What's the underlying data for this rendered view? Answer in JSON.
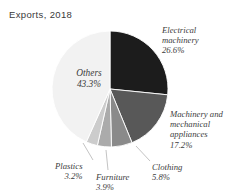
{
  "chart": {
    "title": "Exports, 2018",
    "background_color": "#ffffff",
    "center_x": 110,
    "center_y": 89,
    "radius": 58
  },
  "chart_data": {
    "type": "pie",
    "title": "Exports, 2018",
    "xlabel": "",
    "ylabel": "",
    "units": "percent",
    "start_angle_deg": 0,
    "direction": "clockwise",
    "legend_position": "none",
    "grid": false,
    "categories": [
      "Electrical machinery",
      "Machinery and mechanical appliances",
      "Clothing",
      "Furniture",
      "Plastics",
      "Others"
    ],
    "values": [
      26.6,
      17.2,
      5.8,
      3.9,
      3.2,
      43.3
    ],
    "colors": [
      "#1c1c1c",
      "#585858",
      "#8a8a8a",
      "#ababab",
      "#cccccc",
      "#f2f2f2"
    ],
    "slices": [
      {
        "name": "Electrical machinery",
        "label_line1": "Electrical",
        "label_line2": "machinery",
        "value": 26.6,
        "value_text": "26.6%",
        "color": "#1c1c1c",
        "label_text": "Electrical\nmachinery\n26.6%"
      },
      {
        "name": "Machinery and mechanical appliances",
        "label_line1": "Machinery and",
        "label_line2": "mechanical",
        "label_line3": "appliances",
        "value": 17.2,
        "value_text": "17.2%",
        "color": "#585858",
        "label_text": "Machinery and\nmechanical\nappliances\n17.2%"
      },
      {
        "name": "Clothing",
        "value": 5.8,
        "value_text": "5.8%",
        "color": "#8a8a8a",
        "label_text": "Clothing\n5.8%"
      },
      {
        "name": "Furniture",
        "value": 3.9,
        "value_text": "3.9%",
        "color": "#ababab",
        "label_text": "Furniture\n3.9%"
      },
      {
        "name": "Plastics",
        "value": 3.2,
        "value_text": "3.2%",
        "color": "#cccccc",
        "label_text": "Plastics\n3.2%"
      },
      {
        "name": "Others",
        "value": 43.3,
        "value_text": "43.3%",
        "color": "#f2f2f2",
        "label_text": "Others\n43.3%"
      }
    ]
  }
}
